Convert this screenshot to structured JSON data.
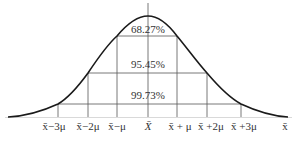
{
  "diagram": {
    "center_label": "X̄",
    "x_axis_end_label": "x̄",
    "percent_labels": [
      {
        "label": "68.27%",
        "x": 148,
        "y": 33
      },
      {
        "label": "95.45%",
        "x": 148,
        "y": 67
      },
      {
        "label": "99.73%",
        "x": 148,
        "y": 98
      }
    ],
    "tick_labels": [
      {
        "label": "x̄−3μ",
        "x": 58
      },
      {
        "label": "x̄−2μ",
        "x": 88
      },
      {
        "label": "x̄−μ",
        "x": 117
      },
      {
        "label": "X̄",
        "x": 148
      },
      {
        "label": "x̄ + μ",
        "x": 180
      },
      {
        "label": "x̄ +2μ",
        "x": 208
      },
      {
        "label": "x̄ +3μ",
        "x": 242
      },
      {
        "label": "x̄",
        "x": 285
      }
    ],
    "colors": {
      "curve": "#1a1a1a",
      "grid": "#555555",
      "text": "#333333"
    }
  }
}
